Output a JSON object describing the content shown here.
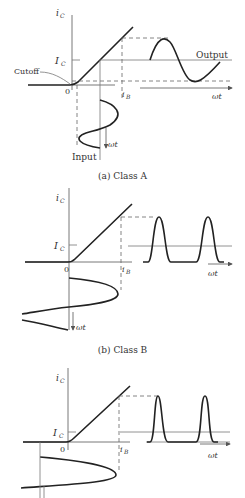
{
  "panels": [
    {
      "id": "a",
      "caption": "(a) Class A",
      "y_label": "i_C",
      "bias_label": "I_C",
      "origin_label": "0",
      "x_label": "i_B",
      "time_label": "ωt",
      "annotations": {
        "cutoff": "Cutoff",
        "output": "Output",
        "input": "Input"
      }
    },
    {
      "id": "b",
      "caption": "(b) Class B",
      "y_label": "i_C",
      "bias_label": "I_C",
      "origin_label": "0",
      "x_label": "i_B",
      "time_label": "ωt"
    },
    {
      "id": "c",
      "caption": "",
      "y_label": "i_C",
      "bias_label": "I_C",
      "origin_label": "0",
      "x_label": "i_B",
      "time_label": "ωt"
    }
  ],
  "labels": {
    "ic": "i",
    "ic_sub": "C",
    "Ic": "I",
    "Ic_sub": "C",
    "ib": "i",
    "ib_sub": "B",
    "zero": "0",
    "wt": "ωt",
    "cutoff": "Cutoff",
    "output": "Output",
    "input": "Input",
    "cap_a": "(a) Class A",
    "cap_b": "(b) Class B"
  }
}
